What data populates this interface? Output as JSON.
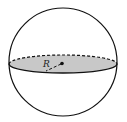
{
  "diagram": {
    "type": "sphere-cross-section",
    "radius_label": "R",
    "colors": {
      "outline": "#111111",
      "fill": "#c8c8c8",
      "background": "#ffffff"
    }
  }
}
